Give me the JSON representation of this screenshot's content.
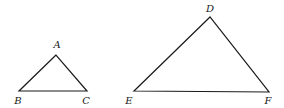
{
  "diagram": {
    "type": "similar-triangles",
    "triangles": [
      {
        "name": "ABC",
        "vertices": [
          {
            "label": "A",
            "x": 56,
            "y": 55,
            "lx": 57,
            "ly": 48
          },
          {
            "label": "B",
            "x": 19,
            "y": 91,
            "lx": 18,
            "ly": 104
          },
          {
            "label": "C",
            "x": 87,
            "y": 91,
            "lx": 86,
            "ly": 104
          }
        ]
      },
      {
        "name": "DEF",
        "vertices": [
          {
            "label": "D",
            "x": 210,
            "y": 17,
            "lx": 210,
            "ly": 12
          },
          {
            "label": "E",
            "x": 134,
            "y": 91,
            "lx": 129,
            "ly": 104
          },
          {
            "label": "F",
            "x": 269,
            "y": 92,
            "lx": 268,
            "ly": 104
          }
        ]
      }
    ],
    "colors": {
      "stroke": "#1a1a1a",
      "background": "#ffffff"
    }
  }
}
